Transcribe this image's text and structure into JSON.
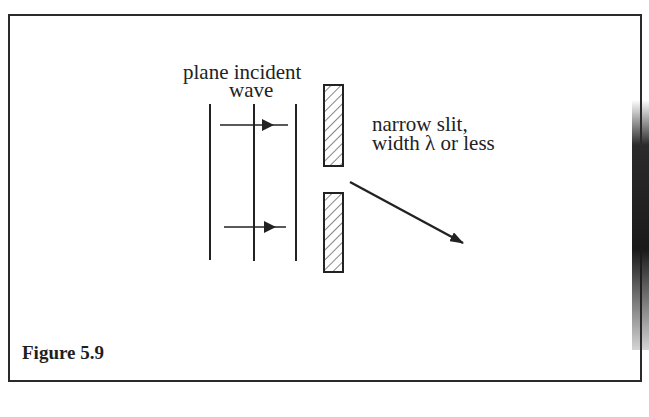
{
  "figure": {
    "caption": "Figure 5.9",
    "labels": {
      "incident_line1": "plane incident",
      "incident_line2": "wave",
      "slit_line1": "narrow slit,",
      "slit_line2": "width λ or less"
    },
    "elements": {
      "wavefronts": 3,
      "propagation_arrows": 2,
      "slit_barriers": 2,
      "diffracted_ray": 1
    },
    "colors": {
      "ink": "#222222",
      "background": "#ffffff",
      "frame": "#2a2a2a"
    }
  }
}
